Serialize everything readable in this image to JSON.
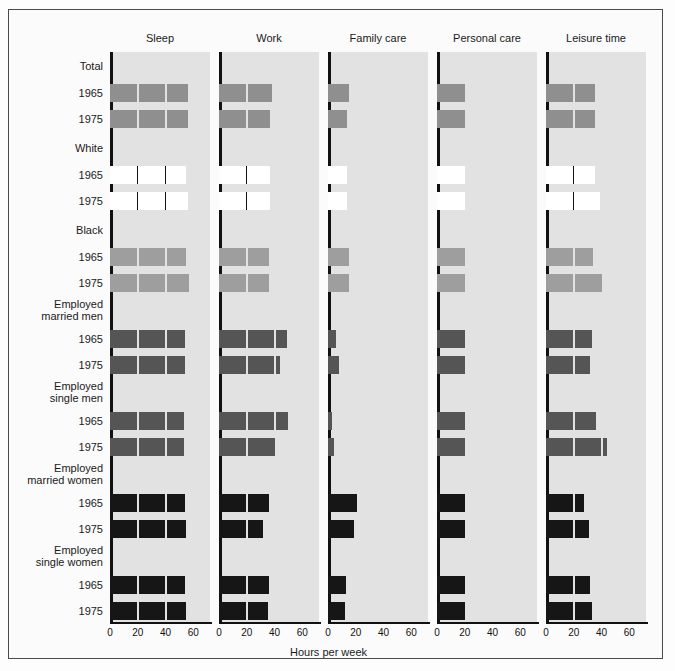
{
  "figure": {
    "xlabel": "Hours per week",
    "columns": [
      "Sleep",
      "Work",
      "Family care",
      "Personal care",
      "Leisure time"
    ],
    "ticks": [
      0,
      20,
      40,
      60
    ],
    "xlim": [
      0,
      72
    ],
    "groups": [
      {
        "label_line1": "Total",
        "label_line2": "",
        "years": [
          "1965",
          "1975"
        ],
        "fill": "hatch-mid"
      },
      {
        "label_line1": "White",
        "label_line2": "",
        "years": [
          "1965",
          "1975"
        ],
        "fill": "white"
      },
      {
        "label_line1": "Black",
        "label_line2": "",
        "years": [
          "1965",
          "1975"
        ],
        "fill": "hatch-light"
      },
      {
        "label_line1": "Employed",
        "label_line2": "married men",
        "years": [
          "1965",
          "1975"
        ],
        "fill": "dark-gray"
      },
      {
        "label_line1": "Employed",
        "label_line2": "single men",
        "years": [
          "1965",
          "1975"
        ],
        "fill": "dark-gray"
      },
      {
        "label_line1": "Employed",
        "label_line2": "married women",
        "years": [
          "1965",
          "1975"
        ],
        "fill": "black"
      },
      {
        "label_line1": "Employed",
        "label_line2": "single women",
        "years": [
          "1965",
          "1975"
        ],
        "fill": "black"
      }
    ]
  },
  "colors": {
    "panel_bg": "#e2e2e2",
    "hatch_mid": "#8f8f8f",
    "hatch_light": "#9e9e9e",
    "white_fill": "#ffffff",
    "dark_gray": "#555555",
    "black_fill": "#161616",
    "axis": "#111111",
    "frame": "#4a4a4a"
  },
  "chart_data": {
    "type": "bar",
    "title": "",
    "xlabel": "Hours per week",
    "ylabel": "",
    "xlim": [
      0,
      72
    ],
    "xticks": [
      0,
      20,
      40,
      60
    ],
    "grid": false,
    "legend": "none",
    "categories": [
      "Sleep",
      "Work",
      "Family care",
      "Personal care",
      "Leisure time"
    ],
    "rows": [
      {
        "group": "Total",
        "year": "1965",
        "values": [
          56,
          38,
          15,
          20,
          35
        ]
      },
      {
        "group": "Total",
        "year": "1975",
        "values": [
          56,
          37,
          14,
          20,
          35
        ]
      },
      {
        "group": "White",
        "year": "1965",
        "values": [
          55,
          37,
          14,
          20,
          35
        ]
      },
      {
        "group": "White",
        "year": "1975",
        "values": [
          56,
          37,
          14,
          20,
          39
        ]
      },
      {
        "group": "Black",
        "year": "1965",
        "values": [
          55,
          36,
          15,
          20,
          34
        ]
      },
      {
        "group": "Black",
        "year": "1975",
        "values": [
          57,
          36,
          15,
          20,
          40
        ]
      },
      {
        "group": "Employed married men",
        "year": "1965",
        "values": [
          54,
          49,
          6,
          20,
          33
        ]
      },
      {
        "group": "Employed married men",
        "year": "1975",
        "values": [
          54,
          44,
          8,
          20,
          32
        ]
      },
      {
        "group": "Employed single men",
        "year": "1965",
        "values": [
          53,
          50,
          3,
          20,
          36
        ]
      },
      {
        "group": "Employed single men",
        "year": "1975",
        "values": [
          53,
          40,
          4,
          20,
          44
        ]
      },
      {
        "group": "Employed married women",
        "year": "1965",
        "values": [
          54,
          36,
          21,
          20,
          27
        ]
      },
      {
        "group": "Employed married women",
        "year": "1975",
        "values": [
          55,
          32,
          19,
          20,
          31
        ]
      },
      {
        "group": "Employed single women",
        "year": "1965",
        "values": [
          54,
          36,
          13,
          20,
          32
        ]
      },
      {
        "group": "Employed single women",
        "year": "1975",
        "values": [
          55,
          35,
          12,
          20,
          33
        ]
      }
    ]
  }
}
